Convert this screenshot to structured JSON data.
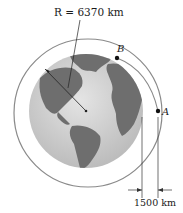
{
  "diagram": {
    "radius_label": "R = 6370 km",
    "point_b_label": "B",
    "point_a_label": "A",
    "altitude_label": "1500 km",
    "colors": {
      "ocean": "#c9c9c9",
      "land": "#6e6e6e",
      "orbit": "#8a8a8a",
      "line": "#222222"
    }
  }
}
